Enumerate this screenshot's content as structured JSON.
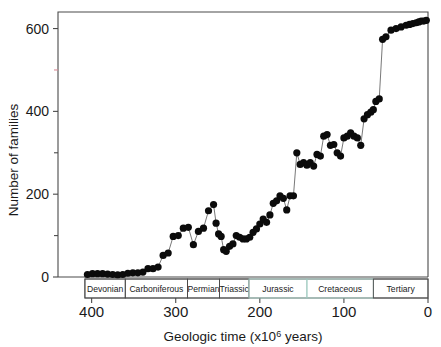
{
  "chart_data": {
    "type": "line",
    "title": "",
    "subtitle": "",
    "xlabel": "Geologic time (x106 years)",
    "xlabel_base": "Geologic time (x10",
    "xlabel_sup": "6",
    "xlabel_tail": " years)",
    "ylabel": "Number of families",
    "xlim": [
      440,
      0
    ],
    "ylim": [
      0,
      640
    ],
    "x_reversed": true,
    "grid": false,
    "legend": null,
    "x_ticks_major": [
      400,
      300,
      200,
      100,
      0
    ],
    "x_tick_labels": [
      "400",
      "300",
      "200",
      "100",
      "0"
    ],
    "y_ticks_major": [
      0,
      200,
      400,
      600
    ],
    "y_tick_labels": [
      "0",
      "200",
      "400",
      "600"
    ],
    "y_ticks_minor": [
      100,
      300,
      500
    ],
    "y_minor_500_color": "#d98a96",
    "marker": "filled-circle",
    "marker_color": "#0b0b0b",
    "line_color": "#555555",
    "period_bands": [
      {
        "name": "Devonian",
        "start": 408,
        "end": 360
      },
      {
        "name": "Carboniferous",
        "start": 360,
        "end": 286
      },
      {
        "name": "Permian",
        "start": 286,
        "end": 248
      },
      {
        "name": "Triassic",
        "start": 248,
        "end": 213
      },
      {
        "name": "Jurassic",
        "start": 213,
        "end": 144
      },
      {
        "name": "Cretaceous",
        "start": 144,
        "end": 65
      },
      {
        "name": "Tertiary",
        "start": 65,
        "end": 0
      }
    ],
    "x": [
      405,
      399,
      393,
      387,
      381,
      375,
      369,
      363,
      357,
      351,
      345,
      339,
      333,
      327,
      321,
      315,
      309,
      303,
      297,
      291,
      285,
      279,
      273,
      267,
      261,
      255,
      252,
      249,
      246,
      243,
      240,
      236,
      232,
      228,
      224,
      220,
      216,
      212,
      208,
      204,
      200,
      196,
      192,
      188,
      184,
      180,
      176,
      172,
      168,
      164,
      160,
      156,
      152,
      148,
      144,
      140,
      136,
      132,
      128,
      124,
      120,
      116,
      112,
      108,
      104,
      100,
      96,
      92,
      88,
      84,
      80,
      76,
      72,
      68,
      65,
      62,
      58,
      54,
      50,
      44,
      38,
      32,
      26,
      22,
      18,
      14,
      11,
      8,
      5,
      2
    ],
    "y": [
      6,
      8,
      8,
      8,
      7,
      6,
      5,
      6,
      9,
      10,
      10,
      12,
      20,
      20,
      24,
      52,
      58,
      98,
      100,
      118,
      120,
      78,
      110,
      118,
      160,
      175,
      130,
      104,
      98,
      66,
      62,
      74,
      80,
      100,
      96,
      92,
      92,
      96,
      108,
      116,
      128,
      140,
      132,
      150,
      178,
      184,
      196,
      190,
      162,
      196,
      196,
      300,
      272,
      276,
      270,
      276,
      268,
      296,
      292,
      340,
      344,
      318,
      320,
      300,
      292,
      336,
      340,
      348,
      340,
      336,
      318,
      382,
      392,
      398,
      404,
      424,
      430,
      574,
      580,
      596,
      600,
      604,
      608,
      610,
      612,
      614,
      616,
      618,
      618,
      620
    ],
    "n_points": 90,
    "notes": [
      "Diversity rises from low Devonian values",
      "Permian peak near 175 families",
      "End-Permian extinction drop to about 62",
      "End-Cretaceous drop then steep Tertiary rise",
      "Modern plateau near 620 families"
    ]
  }
}
